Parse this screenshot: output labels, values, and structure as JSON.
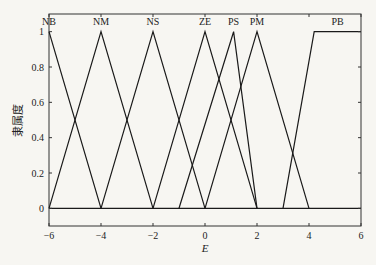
{
  "chart_data": {
    "type": "line",
    "title": "",
    "xlabel": "E",
    "ylabel": "隶属度",
    "xlim": [
      -6,
      6
    ],
    "ylim": [
      -0.1,
      1.1
    ],
    "xticks": [
      -6,
      -4,
      -2,
      0,
      2,
      4,
      6
    ],
    "xtick_labels": [
      "−6",
      "−4",
      "−2",
      "0",
      "2",
      "4",
      "6"
    ],
    "yticks": [
      0,
      0.2,
      0.4,
      0.6,
      0.8,
      1
    ],
    "ytick_labels": [
      "0",
      "0.2",
      "0.4",
      "0.6",
      "0.8",
      "1"
    ],
    "grid": false,
    "legend": "none",
    "series": [
      {
        "name": "NB",
        "x": [
          -6,
          -6,
          -4
        ],
        "y": [
          1,
          1,
          0
        ]
      },
      {
        "name": "NM",
        "x": [
          -6,
          -4,
          -2
        ],
        "y": [
          0,
          1,
          0
        ]
      },
      {
        "name": "NS",
        "x": [
          -4,
          -2,
          0
        ],
        "y": [
          0,
          1,
          0
        ]
      },
      {
        "name": "ZE",
        "x": [
          -2,
          0,
          2
        ],
        "y": [
          0,
          1,
          0
        ]
      },
      {
        "name": "PS",
        "x": [
          -1,
          1.1,
          2
        ],
        "y": [
          0,
          1,
          0
        ]
      },
      {
        "name": "PM",
        "x": [
          0,
          2,
          4
        ],
        "y": [
          0,
          1,
          0
        ]
      },
      {
        "name": "PB",
        "x": [
          3,
          4.2,
          6
        ],
        "y": [
          0,
          1,
          1
        ]
      }
    ],
    "baseline": {
      "y": 0
    },
    "line_color": "#1a1a1a"
  }
}
